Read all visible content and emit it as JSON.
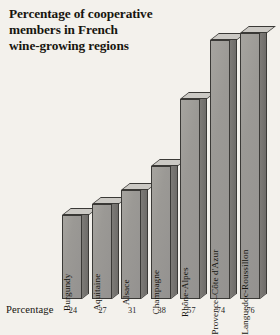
{
  "chart_data": {
    "type": "bar",
    "title": "Percentage of cooperative\nmembers in French\nwine-growing regions",
    "categories": [
      "Burgundy",
      "Aquitaine",
      "Alsace",
      "Champagne",
      "Rhône-Alpes",
      "Provence–Côte d'Azur",
      "Languedoc-Roussillon"
    ],
    "values": [
      24,
      27,
      31,
      38,
      57,
      74,
      76
    ],
    "xlabel": "",
    "ylabel": "Percentage",
    "ylim": [
      0,
      80
    ],
    "grid": false,
    "legend": false,
    "style": "3d-isometric-bars",
    "row_label": "Percentage",
    "colors": {
      "background": "#f3f1ec",
      "bar_front": "#9b9995",
      "bar_top": "#cbc9c4",
      "bar_side": "#76746f",
      "outline": "#3a3936",
      "text": "#17150f"
    }
  }
}
